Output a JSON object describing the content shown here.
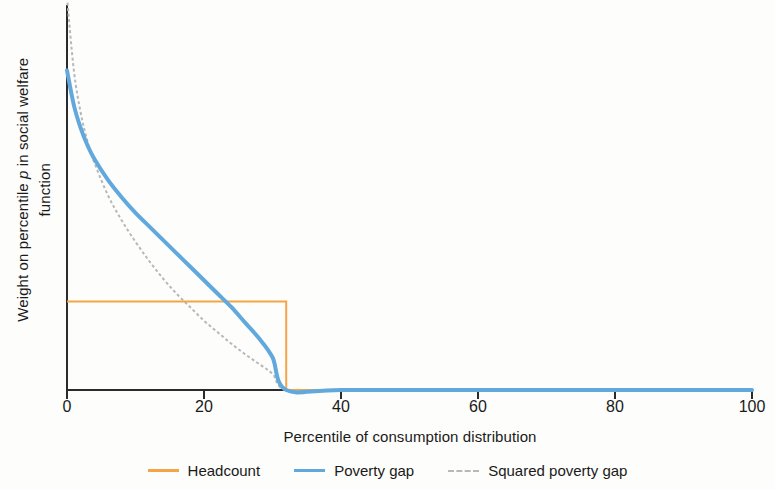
{
  "chart_data": {
    "type": "line",
    "title": "",
    "xlabel": "Percentile of consumption distribution",
    "ylabel_parts": {
      "before": "Weight on percentile ",
      "italic": "p",
      "after": " in social welfare function"
    },
    "ylabel": "Weight on percentile p in social welfare function",
    "xlim": [
      0,
      100
    ],
    "ylim": [
      0,
      1
    ],
    "xticks": [
      0,
      20,
      40,
      60,
      80,
      100
    ],
    "xtick_labels": [
      "0",
      "20",
      "40",
      "60",
      "80",
      "100"
    ],
    "yticks": [],
    "ytick_labels": [],
    "grid": false,
    "legend_position": "bottom",
    "poverty_line_percentile": 32,
    "series": [
      {
        "name": "Headcount",
        "color": "#f4a548",
        "style": "solid",
        "width": 2,
        "x": [
          0,
          32,
          32,
          100
        ],
        "values": [
          0.23,
          0.23,
          0,
          0
        ]
      },
      {
        "name": "Poverty gap",
        "color": "#61a9dd",
        "style": "solid",
        "width": 4,
        "x": [
          0,
          1,
          2,
          3,
          4,
          6,
          8,
          10,
          12,
          14,
          16,
          18,
          20,
          22,
          24,
          26,
          28,
          30,
          32,
          40,
          60,
          80,
          100
        ],
        "values": [
          0.83,
          0.74,
          0.68,
          0.635,
          0.6,
          0.545,
          0.5,
          0.46,
          0.425,
          0.39,
          0.355,
          0.32,
          0.285,
          0.25,
          0.215,
          0.175,
          0.135,
          0.085,
          0,
          0,
          0,
          0,
          0
        ]
      },
      {
        "name": "Squared poverty gap",
        "color": "#b8b8b8",
        "style": "dashed",
        "width": 2,
        "x": [
          0,
          1,
          2,
          3,
          4,
          6,
          8,
          10,
          12,
          14,
          16,
          18,
          20,
          22,
          24,
          26,
          28,
          30,
          32,
          40,
          60,
          80,
          100
        ],
        "values": [
          1.02,
          0.83,
          0.72,
          0.645,
          0.59,
          0.505,
          0.44,
          0.385,
          0.335,
          0.29,
          0.25,
          0.215,
          0.18,
          0.15,
          0.12,
          0.093,
          0.068,
          0.042,
          0,
          0,
          0,
          0,
          0
        ]
      }
    ],
    "legend": [
      {
        "label": "Headcount",
        "color": "#f4a548",
        "style": "solid"
      },
      {
        "label": "Poverty gap",
        "color": "#61a9dd",
        "style": "solid"
      },
      {
        "label": "Squared poverty gap",
        "color": "#b8b8b8",
        "style": "dashed"
      }
    ],
    "axis_color": "#2b2b2b"
  }
}
